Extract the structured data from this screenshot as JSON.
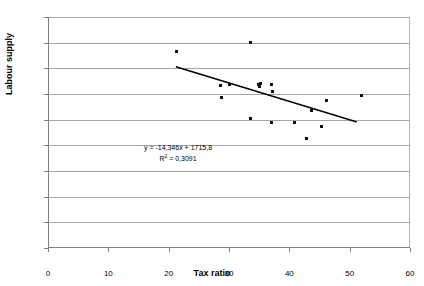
{
  "chart_data": {
    "type": "scatter",
    "title": "",
    "xlabel": "Tax ratio",
    "ylabel": "Labour supply",
    "xlim": [
      0,
      60
    ],
    "ylim": [
      0,
      1800
    ],
    "xticks": [
      0,
      10,
      20,
      30,
      40,
      50,
      60
    ],
    "yticks": [
      0,
      200,
      400,
      600,
      800,
      1000,
      1200,
      1400,
      1600,
      1800
    ],
    "xtick_labels": [
      "0",
      "10",
      "20",
      "30",
      "40",
      "50",
      "60"
    ],
    "ytick_labels": [
      "0",
      "200",
      "400",
      "600",
      "800",
      "1000",
      "1200",
      "1400",
      "1600",
      "1800"
    ],
    "grid": "horizontal",
    "legend": "none",
    "points": [
      {
        "x": 21.3,
        "y": 1530
      },
      {
        "x": 33.6,
        "y": 1598
      },
      {
        "x": 28.6,
        "y": 1267
      },
      {
        "x": 28.8,
        "y": 1172
      },
      {
        "x": 30.0,
        "y": 1277
      },
      {
        "x": 34.9,
        "y": 1272
      },
      {
        "x": 35.1,
        "y": 1262
      },
      {
        "x": 35.2,
        "y": 1283
      },
      {
        "x": 37.1,
        "y": 1272
      },
      {
        "x": 37.2,
        "y": 1222
      },
      {
        "x": 33.6,
        "y": 1010
      },
      {
        "x": 37.0,
        "y": 975
      },
      {
        "x": 40.9,
        "y": 975
      },
      {
        "x": 42.8,
        "y": 857
      },
      {
        "x": 43.6,
        "y": 1068
      },
      {
        "x": 45.3,
        "y": 945
      },
      {
        "x": 46.2,
        "y": 1148
      },
      {
        "x": 52.0,
        "y": 1190
      }
    ],
    "trendline": {
      "slope": -14.346,
      "intercept": 1715.8,
      "x_start": 21.2,
      "x_end": 51.2,
      "y_start": 1411.6,
      "y_end": 981.2,
      "r_squared": 0.3091,
      "equation_text": "y = -14,346x + 1715,8",
      "r_squared_text": "R",
      "r_squared_sup": "2",
      "r_squared_value": " = 0,3091"
    },
    "colors": {
      "marker": "#111111",
      "trendline": "#000000",
      "gridline": "#a6a6a6",
      "axis": "#808080",
      "background": "#ffffff"
    }
  }
}
